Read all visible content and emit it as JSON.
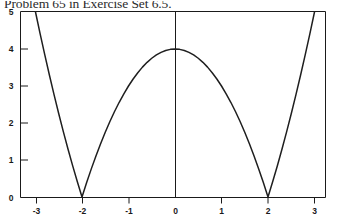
{
  "caption": {
    "text": "Problem 65 in Exercise Set 6.5."
  },
  "chart_data": {
    "type": "line",
    "title": "",
    "subtitle": "",
    "xlabel": "",
    "ylabel": "",
    "function": "y = |4 - x^2|",
    "xlim": [
      -3.3,
      3.2
    ],
    "ylim": [
      0,
      5
    ],
    "xticks": [
      -3,
      -2,
      -1,
      0,
      1,
      2,
      3
    ],
    "xtick_labels": [
      "-3",
      "-2",
      "-1",
      "0",
      "1",
      "2",
      "3"
    ],
    "yticks": [
      0,
      1,
      2,
      3,
      4,
      5
    ],
    "ytick_labels": [
      "0",
      "1",
      "2",
      "3",
      "4",
      "5"
    ],
    "grid": false,
    "legend": false,
    "legend_position": "none",
    "line_color": "#1f1f1f",
    "axis_color": "#1a1a1a",
    "background": "#ffffff",
    "annotations": [
      {
        "label": "vertex",
        "x": 0,
        "y": 4
      },
      {
        "label": "zero-left",
        "x": -2,
        "y": 0
      },
      {
        "label": "zero-right",
        "x": 2,
        "y": 0
      }
    ],
    "x": [
      -3.3,
      -3.2,
      -3.1,
      -3.0,
      -2.9,
      -2.8,
      -2.7,
      -2.6,
      -2.5,
      -2.4,
      -2.3,
      -2.2,
      -2.1,
      -2.0,
      -1.9,
      -1.8,
      -1.7,
      -1.6,
      -1.5,
      -1.4,
      -1.3,
      -1.2,
      -1.1,
      -1.0,
      -0.9,
      -0.8,
      -0.7,
      -0.6,
      -0.5,
      -0.4,
      -0.3,
      -0.2,
      -0.1,
      0.0,
      0.1,
      0.2,
      0.3,
      0.4,
      0.5,
      0.6,
      0.7,
      0.8,
      0.9,
      1.0,
      1.1,
      1.2,
      1.3,
      1.4,
      1.5,
      1.6,
      1.7,
      1.8,
      1.9,
      2.0,
      2.1,
      2.2,
      2.3,
      2.4,
      2.5,
      2.6,
      2.7,
      2.8,
      2.9,
      3.0,
      3.1,
      3.2
    ],
    "y": [
      6.89,
      6.24,
      5.61,
      5.0,
      4.41,
      3.84,
      3.29,
      2.76,
      2.25,
      1.76,
      1.29,
      0.84,
      0.41,
      0.0,
      0.39,
      0.76,
      1.11,
      1.44,
      1.75,
      2.04,
      2.31,
      2.56,
      2.79,
      3.0,
      3.19,
      3.36,
      3.51,
      3.64,
      3.75,
      3.84,
      3.91,
      3.96,
      3.99,
      4.0,
      3.99,
      3.96,
      3.91,
      3.84,
      3.75,
      3.64,
      3.51,
      3.36,
      3.19,
      3.0,
      2.79,
      2.56,
      2.31,
      2.04,
      1.75,
      1.44,
      1.11,
      0.76,
      0.39,
      0.0,
      0.41,
      0.84,
      1.29,
      1.76,
      2.25,
      2.76,
      3.29,
      3.84,
      4.41,
      5.0,
      5.61,
      6.24
    ]
  },
  "axes_geometry": {
    "x_origin_px": 175,
    "y_zero_px": 197,
    "px_per_x_unit": 46.5,
    "px_per_y_unit": 37.0,
    "frame_left_px": 20,
    "frame_right_px": 325,
    "frame_top_px": 12
  }
}
